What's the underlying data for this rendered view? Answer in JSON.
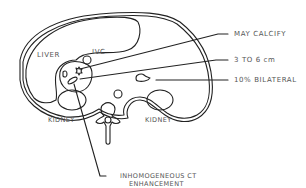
{
  "diagram": {
    "type": "axial CT schematic",
    "stroke_color": "#222222",
    "label_color": "#555555",
    "anatomy_labels": {
      "liver": "LIVER",
      "ivc": "IVC",
      "kidney_left": "KIDNEY",
      "kidney_right": "KIDNEY"
    },
    "callouts": [
      {
        "id": "calcify",
        "text": "MAY CALCIFY"
      },
      {
        "id": "size",
        "text": "3 TO 6 cm"
      },
      {
        "id": "bilateral",
        "text": "10% BILATERAL"
      },
      {
        "id": "enhancement",
        "text": "INHOMOGENEOUS CT",
        "text2": "ENHANCEMENT"
      }
    ]
  }
}
